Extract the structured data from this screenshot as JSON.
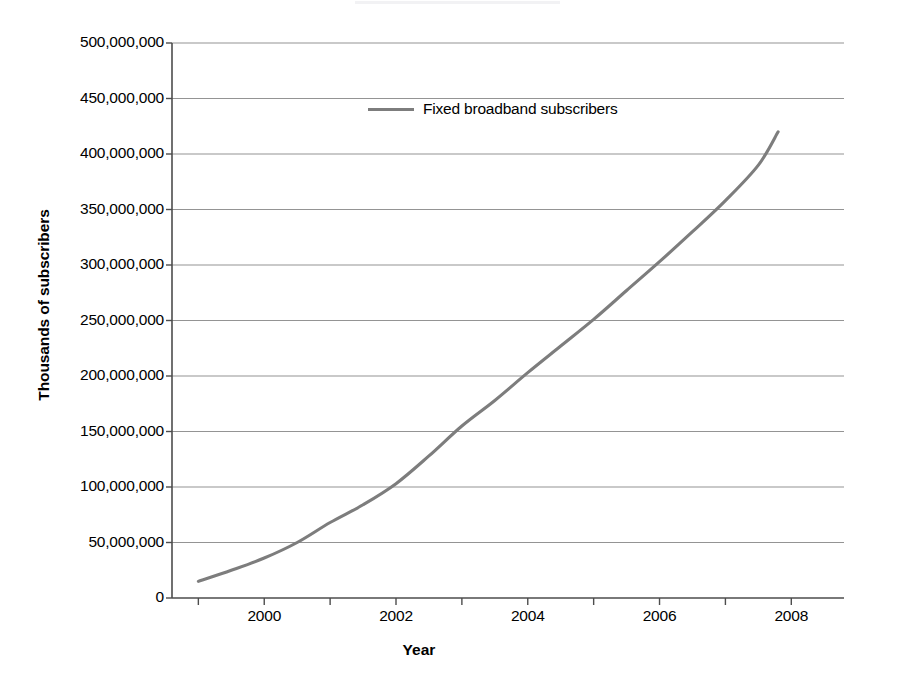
{
  "chart_data": {
    "type": "line",
    "title": "",
    "xlabel": "Year",
    "ylabel": "Thousands of subscribers",
    "xlim": [
      1998.6,
      2008.8
    ],
    "ylim": [
      0,
      500000000
    ],
    "grid": true,
    "grid_axis": "y",
    "legend_position": "top-left-inside",
    "series": [
      {
        "name": "Fixed broadband subscribers",
        "color": "#7d7d7d",
        "x": [
          1999.0,
          1999.5,
          2000.0,
          2000.5,
          2001.0,
          2001.5,
          2002.0,
          2002.5,
          2003.0,
          2003.5,
          2004.0,
          2004.5,
          2005.0,
          2005.5,
          2006.0,
          2006.5,
          2007.0,
          2007.5,
          2007.8
        ],
        "values": [
          15000000,
          25000000,
          36000000,
          50000000,
          68000000,
          84000000,
          103000000,
          128000000,
          155000000,
          178000000,
          203000000,
          227000000,
          251000000,
          277000000,
          303000000,
          330000000,
          358000000,
          390000000,
          420000000
        ]
      }
    ],
    "x_ticks": [
      1999,
      2000,
      2001,
      2002,
      2003,
      2004,
      2005,
      2006,
      2007,
      2008
    ],
    "x_tick_labels": [
      "2000",
      "2002",
      "2004",
      "2006",
      "2008"
    ],
    "x_tick_label_values": [
      2000,
      2002,
      2004,
      2006,
      2008
    ],
    "y_ticks": [
      0,
      50000000,
      100000000,
      150000000,
      200000000,
      250000000,
      300000000,
      350000000,
      400000000,
      450000000,
      500000000
    ],
    "y_tick_labels": [
      "0",
      "50,000,000",
      "100,000,000",
      "150,000,000",
      "200,000,000",
      "250,000,000",
      "300,000,000",
      "350,000,000",
      "400,000,000",
      "450,000,000",
      "500,000,000"
    ],
    "annotations": []
  },
  "legend": {
    "label": "Fixed broadband subscribers"
  },
  "axes": {
    "x_title": "Year",
    "y_title": "Thousands of subscribers"
  },
  "colors": {
    "series_line": "#7d7d7d",
    "gridline": "#949494",
    "axis": "#4d4d4d",
    "text": "#000000",
    "background": "#ffffff"
  }
}
